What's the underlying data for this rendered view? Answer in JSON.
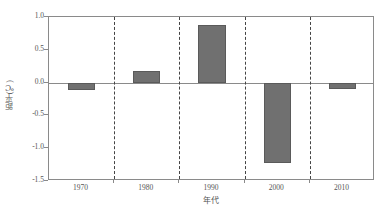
{
  "chart_data": {
    "type": "bar",
    "title": "",
    "subtitle": "",
    "xlabel": "年代",
    "ylabel": "距平(℃)",
    "categories": [
      "1970",
      "1980",
      "1990",
      "2000",
      "2010"
    ],
    "values": [
      -0.12,
      0.18,
      0.88,
      -1.22,
      -0.1
    ],
    "series": [
      {
        "name": "距平(℃)",
        "values": [
          -0.12,
          0.18,
          0.88,
          -1.22,
          -0.1
        ]
      }
    ],
    "ylim": [
      -1.5,
      1.0
    ],
    "ytick_values": [
      1.0,
      0.5,
      0.0,
      -0.5,
      -1.0,
      -1.5
    ],
    "ytick_labels": [
      "1.0",
      "0.5",
      "0.0",
      "-0.5",
      "-1.0",
      "-1.5"
    ],
    "xtick_labels": [
      "1970",
      "1980",
      "1990",
      "2000",
      "2010"
    ],
    "grid": "vertical-dashed-decade-dividers",
    "legend": "none",
    "zero_line": true,
    "bar_color": "#707070",
    "bar_edge_color": "#5a5a5a",
    "axis_color": "#8a8a8a",
    "divider_color": "#444444",
    "background_color": "#ffffff",
    "annotations": []
  }
}
